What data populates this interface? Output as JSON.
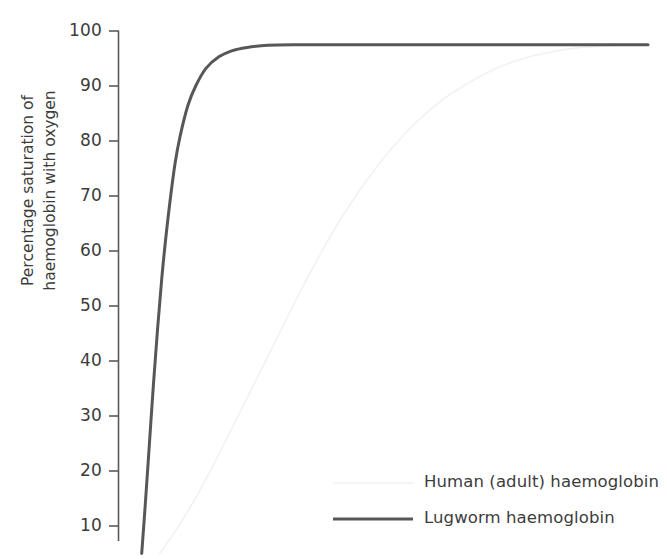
{
  "chart_data": {
    "type": "line",
    "title": "",
    "xlabel": "",
    "ylabel": "Percentage saturation of\nhaemoglobin with oxygen",
    "ylim": [
      5,
      100
    ],
    "xlim": [
      0,
      100
    ],
    "grid": false,
    "y_ticks": [
      100,
      90,
      80,
      70,
      60,
      50,
      40,
      30,
      20,
      10
    ],
    "x_ticks": [],
    "legend_position": "bottom-right",
    "series": [
      {
        "name": "Human (adult) haemoglobin",
        "color": "#f2f2f2",
        "width": 1.6,
        "style": "solid",
        "x": [
          5.0,
          8.0,
          11.0,
          14.0,
          17.0,
          20.0,
          24.0,
          28.0,
          32.0,
          36.0,
          40.0,
          45.0,
          50.0,
          55.0,
          60.0,
          65.0,
          70.0,
          75.0,
          80.0,
          85.0,
          90.0,
          95.0,
          100.0
        ],
        "y": [
          5.0,
          9.0,
          13.5,
          18.5,
          24.0,
          29.5,
          37.0,
          44.5,
          52.0,
          59.0,
          65.5,
          72.5,
          78.5,
          83.5,
          87.5,
          90.5,
          93.0,
          94.8,
          96.0,
          96.8,
          97.2,
          97.4,
          97.5
        ]
      },
      {
        "name": "Lugworm haemoglobin",
        "color": "#575757",
        "width": 3.0,
        "style": "solid",
        "x": [
          1.5,
          2.2,
          3.0,
          3.8,
          4.6,
          5.4,
          6.2,
          7.0,
          8.0,
          9.0,
          10.5,
          12.0,
          14.0,
          16.5,
          19.0,
          22.0,
          26.0,
          32.0,
          40.0,
          50.0,
          60.0,
          70.0,
          80.0,
          90.0,
          100.0
        ],
        "y": [
          5.0,
          14.0,
          25.0,
          36.0,
          46.0,
          55.0,
          62.5,
          69.0,
          76.0,
          81.0,
          86.5,
          90.0,
          93.2,
          95.3,
          96.4,
          97.0,
          97.4,
          97.5,
          97.5,
          97.5,
          97.5,
          97.5,
          97.5,
          97.5,
          97.5
        ]
      }
    ],
    "legend": [
      {
        "label": "Human (adult) haemoglobin",
        "color": "#f2f2f2",
        "width": 1.6
      },
      {
        "label": "Lugworm haemoglobin",
        "color": "#575757",
        "width": 3.0
      }
    ],
    "axis_color": "#5a5a5a",
    "text_color": "#3c3c3c"
  },
  "ticks": {
    "t100": "100",
    "t90": "90",
    "t80": "80",
    "t70": "70",
    "t60": "60",
    "t50": "50",
    "t40": "40",
    "t30": "30",
    "t20": "20",
    "t10": "10"
  },
  "axis": {
    "y_title": "Percentage saturation of\nhaemoglobin with oxygen"
  },
  "legend": {
    "human_label": "Human (adult) haemoglobin",
    "lugworm_label": "Lugworm haemoglobin"
  }
}
